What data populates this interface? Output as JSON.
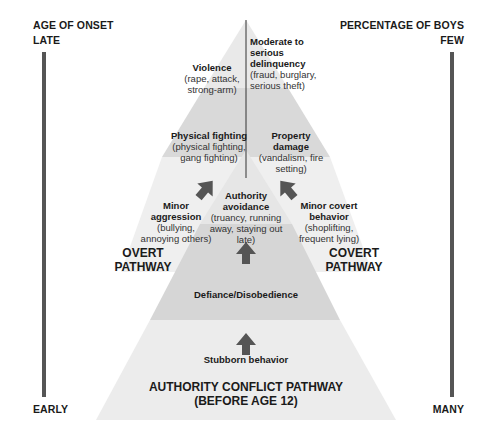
{
  "left_axis": {
    "title": "AGE OF ONSET",
    "top": "LATE",
    "bottom": "EARLY"
  },
  "right_axis": {
    "title": "PERCENTAGE OF BOYS",
    "top": "FEW",
    "bottom": "MANY"
  },
  "colors": {
    "band_light": "#efefef",
    "band_mid": "#e2e2e2",
    "band_dark": "#d4d4d4",
    "axis_bar": "#555555",
    "arrow": "#555555"
  },
  "overt": {
    "top": {
      "title": "Violence",
      "detail": "(rape, attack, strong-arm)"
    },
    "middle": {
      "title": "Physical fighting",
      "detail": "(physical fighting, gang fighting)"
    },
    "bottom": {
      "title": "Minor aggression",
      "detail": "(bullying, annoying others)"
    },
    "pathway": "OVERT PATHWAY"
  },
  "covert": {
    "top": {
      "title": "Moderate to serious delinquency",
      "detail": "(fraud, burglary, serious theft)"
    },
    "middle": {
      "title": "Property damage",
      "detail": "(vandalism, fire setting)"
    },
    "bottom": {
      "title": "Minor covert behavior",
      "detail": "(shoplifting, frequent lying)"
    },
    "pathway": "COVERT PATHWAY"
  },
  "authority": {
    "top": {
      "title": "Authority avoidance",
      "detail": "(truancy, running away, staying out late)"
    },
    "middle": {
      "title": "Defiance/Disobedience"
    },
    "bottom": {
      "title": "Stubborn behavior"
    },
    "pathway_line1": "AUTHORITY CONFLICT PATHWAY",
    "pathway_line2": "(BEFORE AGE 12)"
  }
}
